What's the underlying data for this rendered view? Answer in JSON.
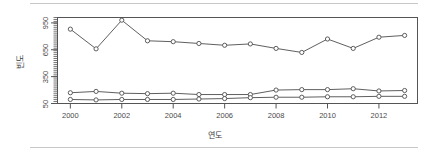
{
  "figure": {
    "name": "line-chart-frequency-by-year",
    "background": "#ffffff",
    "rule_color": "#c8c8c8",
    "axis_color": "#555555",
    "line_color": "#4d4d4d",
    "marker_fill": "#ffffff"
  },
  "chart_data": {
    "type": "line",
    "title": "",
    "xlabel": "연도",
    "ylabel": "빈도",
    "x": [
      2000,
      2001,
      2002,
      2003,
      2004,
      2005,
      2006,
      2007,
      2008,
      2009,
      2010,
      2011,
      2012,
      2013
    ],
    "xlim": [
      1999.5,
      2013.5
    ],
    "ylim": [
      50,
      1010
    ],
    "yticks": [
      50,
      350,
      650,
      950
    ],
    "ytick_labels": [
      "50",
      "350",
      "650",
      "950"
    ],
    "xticks": [
      2000,
      2002,
      2004,
      2006,
      2008,
      2010,
      2012
    ],
    "xtick_labels": [
      "2000",
      "2002",
      "2004",
      "2006",
      "2008",
      "2010",
      "2012"
    ],
    "grid": false,
    "legend": "none",
    "minor_yticks": true,
    "series": [
      {
        "name": "series-upper",
        "marker": "circle-open",
        "values": [
          880,
          660,
          980,
          750,
          740,
          720,
          700,
          715,
          665,
          620,
          770,
          665,
          790,
          810
        ]
      },
      {
        "name": "series-middle",
        "marker": "circle-open",
        "values": [
          170,
          185,
          165,
          160,
          165,
          150,
          150,
          150,
          200,
          205,
          205,
          215,
          190,
          195
        ]
      },
      {
        "name": "series-lower",
        "marker": "circle-open",
        "values": [
          95,
          90,
          95,
          95,
          95,
          100,
          105,
          115,
          120,
          120,
          125,
          125,
          130,
          130
        ]
      }
    ]
  }
}
